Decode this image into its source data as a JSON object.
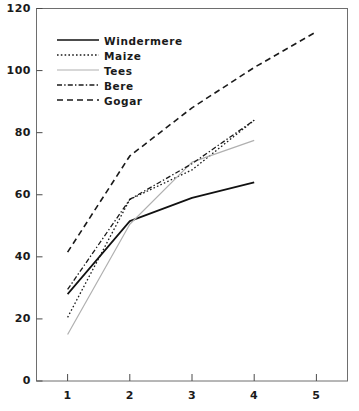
{
  "chart_data": {
    "type": "line",
    "title": "",
    "subtitle": "",
    "xlabel": "",
    "ylabel": "",
    "xlim": [
      0.5,
      5.5
    ],
    "ylim": [
      0,
      120
    ],
    "x": [
      1,
      2,
      3,
      4,
      5
    ],
    "xticks": [
      "1",
      "2",
      "3",
      "4",
      "5"
    ],
    "yticks": [
      "0",
      "20",
      "40",
      "60",
      "80",
      "100",
      "120"
    ],
    "ytick_values": [
      0,
      20,
      40,
      60,
      80,
      100,
      120
    ],
    "grid": false,
    "legend_position": "upper-left",
    "frame": true,
    "series": [
      {
        "name": "Windermere",
        "style": "solid",
        "color": "#111111",
        "width": 1.7,
        "x": [
          1,
          2,
          3,
          4
        ],
        "values": [
          28,
          51.5,
          59,
          64
        ]
      },
      {
        "name": "Maize",
        "style": "dotted",
        "color": "#1a1a1a",
        "width": 1.3,
        "x": [
          1,
          2,
          3,
          4
        ],
        "values": [
          20.5,
          58.5,
          68,
          84
        ]
      },
      {
        "name": "Tees",
        "style": "solid-light",
        "color": "#b0b0b0",
        "width": 1.2,
        "x": [
          1,
          2,
          3,
          4
        ],
        "values": [
          15,
          50.5,
          70.5,
          77.5
        ]
      },
      {
        "name": "Bere",
        "style": "dash-dot",
        "color": "#1a1a1a",
        "width": 1.3,
        "x": [
          1,
          2,
          3,
          4
        ],
        "values": [
          29.5,
          58.5,
          70,
          84
        ]
      },
      {
        "name": "Gogar",
        "style": "dashed",
        "color": "#1a1a1a",
        "width": 1.6,
        "x": [
          1,
          2,
          3,
          4,
          5
        ],
        "values": [
          41.5,
          72.5,
          88,
          101,
          112.5
        ]
      }
    ]
  },
  "legend": {
    "entries": [
      {
        "label": "Windermere"
      },
      {
        "label": "Maize"
      },
      {
        "label": "Tees"
      },
      {
        "label": "Bere"
      },
      {
        "label": "Gogar"
      }
    ]
  }
}
